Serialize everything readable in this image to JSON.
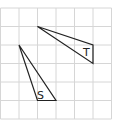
{
  "diagram": {
    "grid": {
      "origin_x": 0.5,
      "origin_y": 8,
      "cell": 18.5,
      "cols": 6,
      "rows": 6,
      "line_color": "#d6d6d6"
    },
    "shapes": [
      {
        "name": "triangle-t",
        "label": "T",
        "points_grid": [
          [
            2,
            1
          ],
          [
            5,
            2
          ],
          [
            5,
            3
          ]
        ],
        "label_pos": [
          83,
          56
        ],
        "stroke": "#222222"
      },
      {
        "name": "triangle-s",
        "label": "S",
        "points_grid": [
          [
            1,
            2
          ],
          [
            2,
            5
          ],
          [
            3,
            5
          ]
        ],
        "label_pos": [
          37,
          99
        ],
        "stroke": "#222222"
      }
    ]
  }
}
